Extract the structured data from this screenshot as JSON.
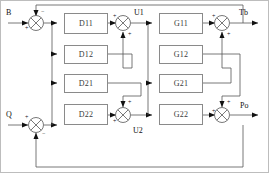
{
  "diagram": {
    "type": "block-diagram",
    "width": 270,
    "height": 174,
    "line_color": "#555555",
    "block_border_color": "#8a8a8a",
    "text_color": "#111111",
    "background": "#ffffff"
  },
  "signals": {
    "input_1": "B",
    "input_2": "Q",
    "inter_1": "U1",
    "inter_2": "U2",
    "output_1": "Tb",
    "output_2": "Po"
  },
  "blocks": [
    {
      "id": "d11",
      "label": "D11",
      "x": 64,
      "y": 13,
      "w": 44,
      "h": 21
    },
    {
      "id": "d12",
      "label": "D12",
      "x": 64,
      "y": 45,
      "w": 44,
      "h": 19
    },
    {
      "id": "d21",
      "label": "D21",
      "x": 64,
      "y": 74,
      "w": 44,
      "h": 19
    },
    {
      "id": "d22",
      "label": "D22",
      "x": 64,
      "y": 104,
      "w": 44,
      "h": 21
    },
    {
      "id": "g11",
      "label": "G11",
      "x": 159,
      "y": 13,
      "w": 44,
      "h": 21
    },
    {
      "id": "g12",
      "label": "G12",
      "x": 159,
      "y": 45,
      "w": 44,
      "h": 19
    },
    {
      "id": "g21",
      "label": "G21",
      "x": 159,
      "y": 74,
      "w": 44,
      "h": 19
    },
    {
      "id": "g22",
      "label": "G22",
      "x": 159,
      "y": 104,
      "w": 44,
      "h": 21
    }
  ],
  "summing_junctions": [
    {
      "id": "sum-b",
      "cx": 36,
      "cy": 23,
      "signs": {
        "left": "+",
        "top": "−"
      }
    },
    {
      "id": "sum-u1",
      "cx": 123,
      "cy": 23,
      "signs": {
        "left": "+",
        "bottom": "+"
      }
    },
    {
      "id": "sum-tb",
      "cx": 222,
      "cy": 23,
      "signs": {
        "left": "+",
        "bottom": "+"
      }
    },
    {
      "id": "sum-q",
      "cx": 36,
      "cy": 125,
      "signs": {
        "left": "+",
        "bottom": "−"
      }
    },
    {
      "id": "sum-u2",
      "cx": 123,
      "cy": 125,
      "signs": {
        "left": "+",
        "top": "+"
      }
    },
    {
      "id": "sum-po",
      "cx": 222,
      "cy": 125,
      "signs": {
        "left": "+",
        "top": "+"
      }
    }
  ],
  "signs": {
    "plus": "+",
    "minus": "−"
  },
  "connections": [
    "B -> sum-b (+)",
    "sum-b -> D11 and D21 (branch)",
    "D11 -> sum-u1 (+)",
    "D12 -> sum-u1 (+) via crossover",
    "D21 -> sum-u2 (+) via crossover",
    "D22 -> sum-u2 (+)",
    "sum-u1 -> U1 -> G11 and G12 (branch)",
    "sum-u2 -> U2 -> G21 and G22 (branch)",
    "G11 -> sum-tb (+)",
    "G21 -> sum-tb (+) via crossover",
    "G12 -> sum-po (+) via crossover",
    "G22 -> sum-po (+)",
    "sum-tb -> Tb output, feedback to sum-b (-)",
    "sum-po -> Po output, feedback to sum-q (-)",
    "Q -> sum-q (+)"
  ]
}
